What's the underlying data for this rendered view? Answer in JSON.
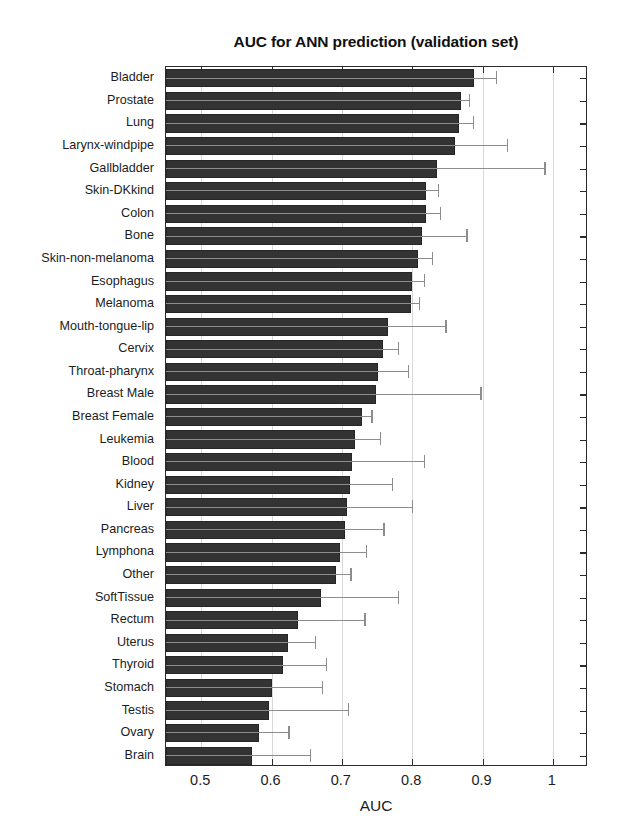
{
  "chart_data": {
    "type": "bar",
    "orientation": "horizontal",
    "title": "AUC for ANN prediction (validation set)",
    "xlabel": "AUC",
    "ylabel": "",
    "xlim": [
      0.45,
      1.05
    ],
    "xticks": [
      0.5,
      0.6,
      0.7,
      0.8,
      0.9,
      1.0
    ],
    "xticklabels": [
      "0.5",
      "0.6",
      "0.7",
      "0.8",
      "0.9",
      "1"
    ],
    "grid": true,
    "legend": null,
    "bar_color": "#333333",
    "errorbar_color": "#8d8d8d",
    "baseline": 0.45,
    "categories": [
      "Bladder",
      "Prostate",
      "Lung",
      "Larynx-windpipe",
      "Gallbladder",
      "Skin-DKkind",
      "Colon",
      "Bone",
      "Skin-non-melanoma",
      "Esophagus",
      "Melanoma",
      "Mouth-tongue-lip",
      "Cervix",
      "Throat-pharynx",
      "Breast Male",
      "Breast Female",
      "Leukemia",
      "Blood",
      "Kidney",
      "Liver",
      "Pancreas",
      "Lymphona",
      "Other",
      "SoftTissue",
      "Rectum",
      "Uterus",
      "Thyroid",
      "Stomach",
      "Testis",
      "Ovary",
      "Brain"
    ],
    "values": [
      0.888,
      0.869,
      0.866,
      0.861,
      0.836,
      0.82,
      0.819,
      0.814,
      0.809,
      0.8,
      0.798,
      0.766,
      0.758,
      0.752,
      0.749,
      0.729,
      0.719,
      0.714,
      0.711,
      0.707,
      0.705,
      0.697,
      0.692,
      0.67,
      0.637,
      0.624,
      0.616,
      0.6,
      0.597,
      0.582,
      0.572
    ],
    "errorbar_upper": [
      0.92,
      0.882,
      0.887,
      0.935,
      0.989,
      0.838,
      0.84,
      0.878,
      0.829,
      0.817,
      0.81,
      0.848,
      0.78,
      0.795,
      0.898,
      0.743,
      0.755,
      0.817,
      0.772,
      0.8,
      0.76,
      0.735,
      0.713,
      0.781,
      0.733,
      0.663,
      0.678,
      0.672,
      0.71,
      0.625,
      0.656
    ]
  }
}
